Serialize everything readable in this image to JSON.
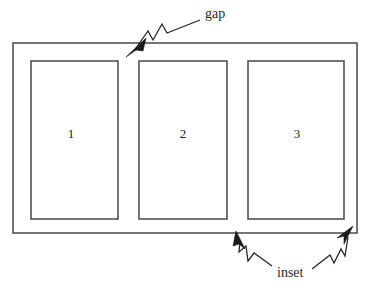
{
  "diagram": {
    "background_color": "#ffffff",
    "line_color": "#3b3b3b",
    "annotation_color": "#2a2a2a",
    "text_color": "#1a1a1a",
    "outer_frame": {
      "name": "outer-container",
      "x": 13,
      "y": 43,
      "width": 344,
      "height": 190
    },
    "panels": [
      {
        "label": "1",
        "x": 31,
        "y": 61,
        "width": 87,
        "height": 158,
        "label_x": 71,
        "label_y": 135
      },
      {
        "label": "2",
        "x": 139,
        "y": 61,
        "width": 88,
        "height": 158,
        "label_x": 183,
        "label_y": 135
      },
      {
        "label": "3",
        "x": 248,
        "y": 61,
        "width": 96,
        "height": 158,
        "label_x": 297,
        "label_y": 135
      }
    ],
    "annotations": [
      {
        "name": "gap",
        "label": "gap",
        "label_x": 205,
        "label_y": 15,
        "leader_path": "M 200 20 L 167 33 L 162 24 L 153 40 L 148 31 L 134 51",
        "arrow_points": "126,57 146,38 143,51 136,50",
        "target_x": 128,
        "target_y": 56
      },
      {
        "name": "inset-left",
        "label": "inset",
        "label_x": 277,
        "label_y": 274,
        "leader_path": "M 272 266 L 254 253 L 248 261 L 246 246 L 239 252 L 240 240",
        "arrow_points": "236,231 245,249 239,244 233,246",
        "target_x": 237,
        "target_y": 233
      },
      {
        "name": "inset-right",
        "label": "inset",
        "label_x": 277,
        "label_y": 274,
        "leader_path": "M 312 269 L 330 255 L 334 263 L 341 249 L 345 256 L 348 237",
        "arrow_points": "353,226 344,244 344,236 337,238",
        "target_x": 352,
        "target_y": 227
      }
    ],
    "shared_inset_label": {
      "text": "inset",
      "x": 277,
      "y": 274
    }
  }
}
